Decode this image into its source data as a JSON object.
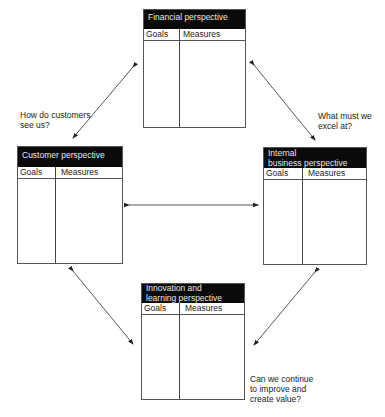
{
  "diagram": {
    "type": "balanced-scorecard",
    "boxes": {
      "financial": {
        "title": "Financial perspective",
        "goals_label": "Goals",
        "measures_label": "Measures"
      },
      "customer": {
        "title": "Customer perspective",
        "goals_label": "Goals",
        "measures_label": "Measures"
      },
      "internal": {
        "title_line1": "Internal",
        "title_line2": "business perspective",
        "goals_label": "Goals",
        "measures_label": "Measures"
      },
      "innovation": {
        "title_line1": "Innovation and",
        "title_line2": "learning perspective",
        "goals_label": "Goals",
        "measures_label": "Measures"
      }
    },
    "questions": {
      "customer_line1": "How do customers",
      "customer_line2": "see us?",
      "internal_line1": "What must we",
      "internal_line2": "excel at?",
      "innovation_line1": "Can we continue",
      "innovation_line2": "to improve and",
      "innovation_line3": "create value?"
    },
    "connectors": [
      {
        "from": "financial",
        "to": "customer",
        "style": "double-arrow"
      },
      {
        "from": "financial",
        "to": "internal",
        "style": "double-arrow"
      },
      {
        "from": "customer",
        "to": "internal",
        "style": "double-arrow"
      },
      {
        "from": "customer",
        "to": "innovation",
        "style": "double-arrow"
      },
      {
        "from": "internal",
        "to": "innovation",
        "style": "double-arrow"
      }
    ]
  }
}
